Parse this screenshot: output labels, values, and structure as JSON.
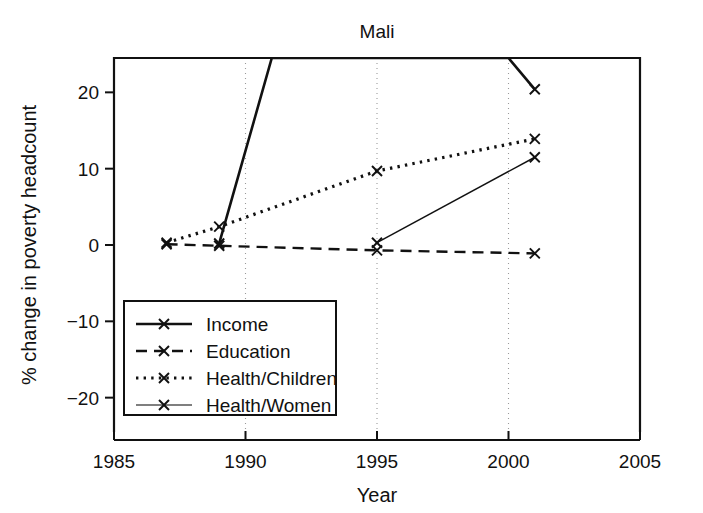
{
  "chart_data": {
    "type": "line",
    "title": "Mali",
    "xlabel": "Year",
    "ylabel": "% change in poverty headcount",
    "xlim": [
      1985,
      2005
    ],
    "ylim": [
      -24.5,
      24.5
    ],
    "xticks": [
      1985,
      1990,
      1995,
      2000,
      2005
    ],
    "xtick_labels": [
      "1985",
      "1990",
      "1995",
      "2000",
      "2005"
    ],
    "yticks": [
      20,
      10,
      0,
      -10,
      -20
    ],
    "ytick_labels": [
      "20",
      "10",
      "0",
      "−10",
      "−20"
    ],
    "grid": "vertical dotted gridlines at 1990, 1995, 2000",
    "legend_position": "lower left inside axes",
    "series": [
      {
        "name": "Income",
        "linestyle": "solid",
        "marker": "x",
        "color": "#111111",
        "x": [
          1989,
          1991,
          2000,
          2001
        ],
        "y": [
          0.2,
          24.5,
          24.5,
          20.4
        ],
        "note": "line rises off the top of the plot between 1991 and 2000; only the 1989 and 2001 markers are visible"
      },
      {
        "name": "Education",
        "linestyle": "dashed",
        "marker": "x",
        "color": "#111111",
        "x": [
          1987,
          1989,
          1995,
          2001
        ],
        "y": [
          0.1,
          -0.1,
          -0.7,
          -1.1
        ]
      },
      {
        "name": "Health/Children",
        "linestyle": "dotted",
        "marker": "x",
        "color": "#111111",
        "x": [
          1987,
          1989,
          1995,
          2001
        ],
        "y": [
          0.3,
          2.4,
          9.7,
          13.9
        ]
      },
      {
        "name": "Health/Women",
        "linestyle": "solid-thin",
        "marker": "x",
        "color": "#555555",
        "x": [
          1995,
          2001
        ],
        "y": [
          0.3,
          11.5
        ]
      }
    ],
    "legend_entries": [
      {
        "label": "Income",
        "linestyle": "solid",
        "marker": "x"
      },
      {
        "label": "Education",
        "linestyle": "dashed",
        "marker": "x"
      },
      {
        "label": "Health/Children",
        "linestyle": "dotted",
        "marker": "x"
      },
      {
        "label": "Health/Women",
        "linestyle": "solid-thin",
        "marker": "x"
      }
    ]
  },
  "colors": {
    "background": "#ffffff",
    "foreground": "#111111",
    "grid": "#9a9a9a",
    "thin_series": "#555555"
  }
}
